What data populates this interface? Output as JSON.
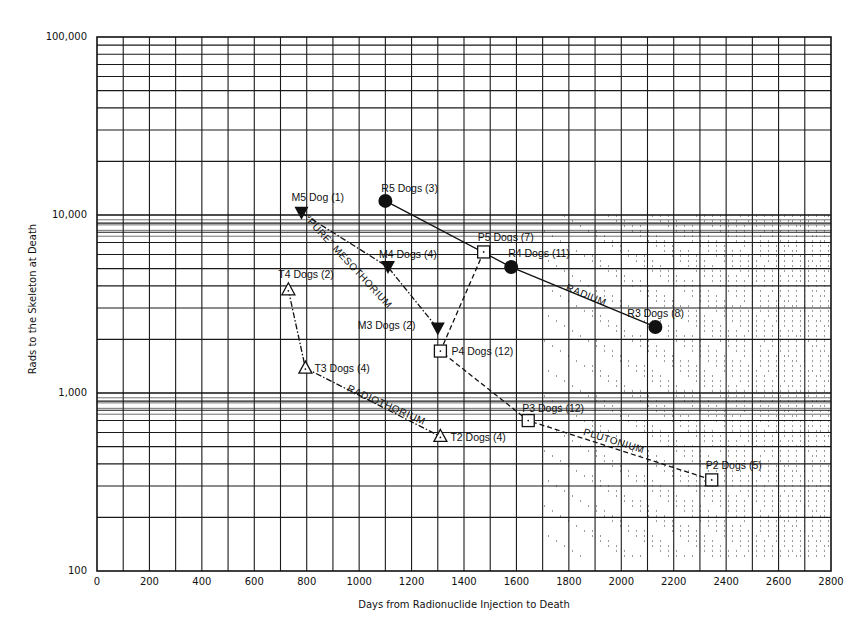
{
  "chart_data": {
    "type": "scatter",
    "title": "",
    "xlabel": "Days from Radionuclide Injection to Death",
    "ylabel": "Rads to the Skeleton at Death",
    "xlim": [
      0,
      2800
    ],
    "ylim": [
      100,
      100000
    ],
    "yscale": "log",
    "grid": true,
    "x_ticks": [
      0,
      200,
      400,
      600,
      800,
      1000,
      1200,
      1400,
      1600,
      1800,
      2000,
      2200,
      2400,
      2600,
      2800
    ],
    "x_tick_labels": [
      "0",
      "200",
      "400",
      "600",
      "800",
      "1000",
      "1200",
      "1400",
      "1600",
      "1800",
      "2000",
      "2200",
      "2400",
      "2600",
      "2800"
    ],
    "y_ticks": [
      100,
      1000,
      10000,
      100000
    ],
    "y_tick_labels": [
      "100",
      "1,000",
      "10,000",
      "100,000"
    ],
    "legend": null,
    "series": [
      {
        "name": "Radium",
        "line_label": "RADIUM",
        "marker": "filled-circle",
        "line_style": "solid",
        "points": [
          {
            "label": "R5 Dogs (3)",
            "x": 1100,
            "y": 12000
          },
          {
            "label": "R4 Dogs (11)",
            "x": 1580,
            "y": 5100
          },
          {
            "label": "R3 Dogs (8)",
            "x": 2130,
            "y": 2350
          }
        ]
      },
      {
        "name": "\"Pure\" Mesothorium",
        "line_label": "\"PURE\" MESOTHORIUM",
        "marker": "filled-down-triangle",
        "line_style": "dash-dot",
        "points": [
          {
            "label": "M5 Dog (1)",
            "x": 780,
            "y": 10300
          },
          {
            "label": "M4 Dogs (4)",
            "x": 1110,
            "y": 5100
          },
          {
            "label": "M3 Dogs (2)",
            "x": 1300,
            "y": 2300
          }
        ]
      },
      {
        "name": "Plutonium",
        "line_label": "PLUTONIUM",
        "marker": "open-square",
        "line_style": "dashed",
        "points": [
          {
            "label": "P5 Dogs (7)",
            "x": 1475,
            "y": 6200
          },
          {
            "label": "P4 Dogs (12)",
            "x": 1310,
            "y": 1720
          },
          {
            "label": "P3 Dogs (12)",
            "x": 1645,
            "y": 700
          },
          {
            "label": "P2 Dogs (5)",
            "x": 2345,
            "y": 325
          }
        ]
      },
      {
        "name": "Radiothorium",
        "line_label": "RADIOTHORIUM",
        "marker": "open-triangle",
        "line_style": "dash-dot",
        "points": [
          {
            "label": "T4 Dogs (2)",
            "x": 730,
            "y": 3800
          },
          {
            "label": "T3 Dogs (4)",
            "x": 795,
            "y": 1380
          },
          {
            "label": "T2 Dogs (4)",
            "x": 1310,
            "y": 570
          }
        ]
      }
    ]
  }
}
